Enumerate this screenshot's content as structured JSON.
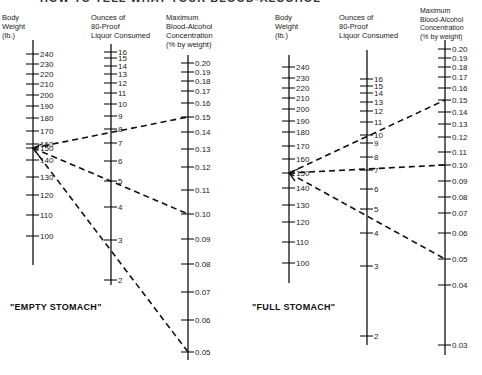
{
  "title_partial": "HOW TO TELL WHAT YOUR BLOOD-ALCOHOL",
  "charts": [
    {
      "id": "empty",
      "caption": "\"EMPTY STOMACH\"",
      "headers": {
        "body": "Body\nWeight\n(lb.)",
        "liquor": "Ounces of\n80-Proof\nLiquor Consumed",
        "bac": "Maximum\nBlood-Alcohol\nConcentration\n(% by weight)"
      }
    },
    {
      "id": "full",
      "caption": "\"FULL STOMACH\"",
      "headers": {
        "body": "Body\nWeight\n(lb.)",
        "liquor": "Ounces of\n80-Proof\nLiquor Consumed",
        "bac": "Maximum\nBlood-Alcohol\nConcentration\n(% by weight)"
      }
    }
  ],
  "chart_data": [
    {
      "type": "nomogram",
      "title": "EMPTY STOMACH",
      "axes": [
        {
          "name": "Body Weight (lb.)",
          "ticks": [
            240,
            230,
            220,
            210,
            200,
            190,
            180,
            170,
            160,
            150,
            140,
            130,
            120,
            110,
            100
          ]
        },
        {
          "name": "Ounces of 80-Proof Liquor Consumed",
          "ticks": [
            16,
            15,
            14,
            13,
            12,
            11,
            10,
            9,
            8,
            7,
            6,
            5,
            4,
            3,
            2
          ]
        },
        {
          "name": "Maximum Blood-Alcohol Concentration (% by weight)",
          "ticks": [
            0.2,
            0.19,
            0.18,
            0.17,
            0.16,
            0.15,
            0.14,
            0.13,
            0.12,
            0.11,
            0.1,
            0.09,
            0.08,
            0.07,
            0.06,
            0.05
          ]
        }
      ],
      "example_lines": [
        {
          "body_weight": 150,
          "liquor_oz": 8,
          "bac": 0.15
        },
        {
          "body_weight": 150,
          "liquor_oz": 5,
          "bac": 0.1
        },
        {
          "body_weight": 150,
          "liquor_oz": 2.7,
          "bac": 0.05
        }
      ]
    },
    {
      "type": "nomogram",
      "title": "FULL STOMACH",
      "axes": [
        {
          "name": "Body Weight (lb.)",
          "ticks": [
            240,
            230,
            220,
            210,
            200,
            190,
            180,
            170,
            160,
            150,
            140,
            130,
            120,
            110,
            100
          ]
        },
        {
          "name": "Ounces of 80-Proof Liquor Consumed",
          "ticks": [
            16,
            15,
            14,
            13,
            12,
            11,
            10,
            9,
            8,
            7,
            6,
            5,
            4,
            3,
            2
          ]
        },
        {
          "name": "Maximum Blood-Alcohol Concentration (% by weight)",
          "ticks": [
            0.2,
            0.19,
            0.18,
            0.17,
            0.16,
            0.15,
            0.14,
            0.13,
            0.12,
            0.11,
            0.1,
            0.09,
            0.08,
            0.07,
            0.06,
            0.05,
            0.04,
            0.03
          ]
        }
      ],
      "example_lines": [
        {
          "body_weight": 150,
          "liquor_oz": 9.8,
          "bac": 0.15
        },
        {
          "body_weight": 150,
          "liquor_oz": 7,
          "bac": 0.1
        },
        {
          "body_weight": 150,
          "liquor_oz": 4.7,
          "bac": 0.05
        }
      ]
    }
  ]
}
